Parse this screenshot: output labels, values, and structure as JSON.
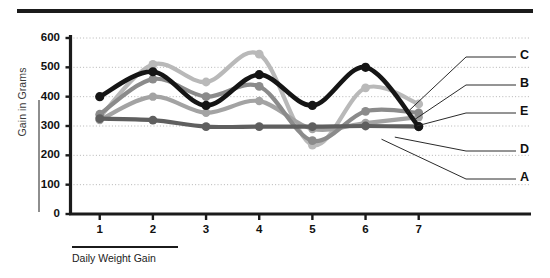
{
  "chart_data": {
    "type": "line",
    "title": "",
    "subtitle": "",
    "xlabel": "Daily Weight Gain",
    "ylabel": "Gain in Grams",
    "x": [
      1,
      2,
      3,
      4,
      5,
      6,
      7
    ],
    "categories": [
      "1",
      "2",
      "3",
      "4",
      "5",
      "6",
      "7"
    ],
    "xtick_labels": [
      "1",
      "2",
      "3",
      "4",
      "5",
      "6",
      "7"
    ],
    "ytick_labels": [
      "0",
      "100",
      "200",
      "300",
      "400",
      "500",
      "600"
    ],
    "ytick_values": [
      0,
      100,
      200,
      300,
      400,
      500,
      600
    ],
    "ylim": [
      0,
      600
    ],
    "xlim": [
      0.45,
      7.25
    ],
    "grid": "horizontal-dotted",
    "legend_position": "right-leader-lines",
    "smoothing": "spline",
    "markers": "circle",
    "series": [
      {
        "name": "C",
        "label": "C",
        "color": "#151515",
        "width": 4.6,
        "marker_size": 4.6,
        "values": [
          400,
          485,
          370,
          475,
          370,
          500,
          298
        ]
      },
      {
        "name": "B",
        "label": "B",
        "color": "#b9b9b9",
        "width": 4.2,
        "marker_size": 4.4,
        "values": [
          330,
          510,
          450,
          545,
          235,
          430,
          375
        ]
      },
      {
        "name": "E",
        "label": "E",
        "color": "#8b8b8b",
        "width": 4.2,
        "marker_size": 4.4,
        "values": [
          340,
          460,
          400,
          435,
          250,
          350,
          345
        ]
      },
      {
        "name": "D",
        "label": "D",
        "color": "#a3a3a3",
        "width": 4.2,
        "marker_size": 4.2,
        "values": [
          320,
          400,
          345,
          385,
          290,
          310,
          330
        ]
      },
      {
        "name": "A",
        "label": "A",
        "color": "#5f5f5f",
        "width": 4.2,
        "marker_size": 4.4,
        "values": [
          325,
          320,
          298,
          298,
          298,
          300,
          298
        ]
      }
    ]
  },
  "axes": {
    "y_title": "Gain in Grams",
    "x_title": "Daily Weight Gain",
    "y_ticks": [
      "600",
      "500",
      "400",
      "300",
      "200",
      "100",
      "0"
    ],
    "x_ticks": [
      "1",
      "2",
      "3",
      "4",
      "5",
      "6",
      "7"
    ]
  },
  "legend": {
    "items": [
      {
        "label": "C",
        "color": "#151515"
      },
      {
        "label": "B",
        "color": "#b9b9b9"
      },
      {
        "label": "E",
        "color": "#8b8b8b"
      },
      {
        "label": "D",
        "color": "#a3a3a3"
      },
      {
        "label": "A",
        "color": "#5f5f5f"
      }
    ]
  },
  "style": {
    "background": "#ffffff",
    "axis_color": "#1b1b1b",
    "grid_color": "#b5b5b5",
    "rule_color": "#1b1b1b"
  }
}
